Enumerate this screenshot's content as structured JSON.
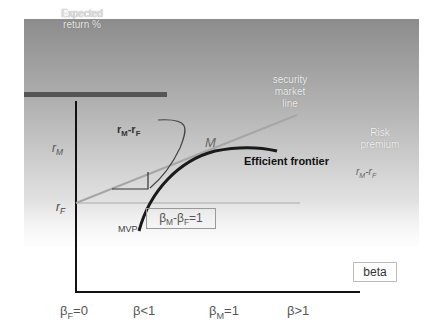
{
  "diagram": {
    "y_axis_label": "Expected return %",
    "x_axis_label": "beta",
    "sml_label": "security market line",
    "risk_premium_label": "Risk premium",
    "risk_premium_formula": "r_M - r_F",
    "rm_label": "r_M",
    "rf_label": "r_F",
    "rmrf_label": "r_M - r_F",
    "market_point_label": "M",
    "efficient_frontier_label": "Efficient frontier",
    "mvp_label": "MVP",
    "beta_diff_label": "β_M - β_F = 1",
    "x_ticks": [
      "β_F=0",
      "β<1",
      "β_M=1",
      "β>1"
    ]
  },
  "text": {
    "ylabel_line1": "Expected",
    "ylabel_line2": "return %",
    "sml_line1": "security",
    "sml_line2": "market",
    "sml_line3": "line",
    "risk_line1": "Risk",
    "risk_line2": "premium",
    "r": "r",
    "sub_M": "M",
    "sub_F": "F",
    "dash": "-",
    "M": "M",
    "ef": "Efficient frontier",
    "mvp": "MVP",
    "beta": "β",
    "beta_diff_tail": "=1",
    "beta_axis": "beta",
    "tick_eq0": "=0",
    "tick_lt1": "β<1",
    "tick_eq1": "=1",
    "tick_gt1": "β>1"
  },
  "colors": {
    "panel_top": "#8c8c8c",
    "axis": "#111111",
    "header_bar": "#555555",
    "sml_line": "#a8a8a8",
    "frontier": "#1a1a1a"
  }
}
